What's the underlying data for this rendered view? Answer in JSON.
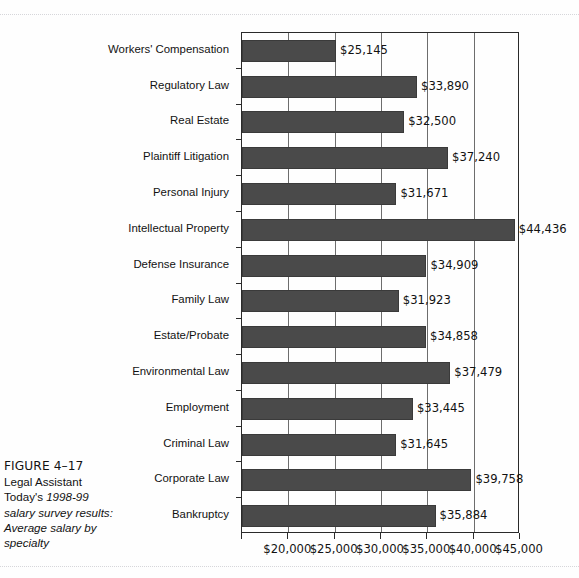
{
  "figure": {
    "number_label": "FIGURE 4–17",
    "caption_lines": [
      {
        "text": "Legal Assistant",
        "italic": false
      },
      {
        "text": "Today's ",
        "italic": false,
        "tail": "1998-99",
        "tail_italic": true
      },
      {
        "text": "salary survey results:",
        "italic": true
      },
      {
        "text": "Average salary by",
        "italic": true
      },
      {
        "text": "specialty",
        "italic": true
      }
    ]
  },
  "colors": {
    "bar_fill": "#4a4a4a",
    "bar_stroke": "#3a3a3a",
    "axis": "#2a2a2a",
    "gridline": "#6d6d6d",
    "text": "#121212",
    "page_background": "#fefefe"
  },
  "chart_data": {
    "type": "bar",
    "orientation": "horizontal",
    "title": "",
    "subtitle": "",
    "xlabel": "",
    "ylabel": "",
    "xlim": [
      15000,
      45000
    ],
    "grid": true,
    "legend": "none",
    "value_label_format": "$#,###",
    "xticks": [
      20000,
      25000,
      30000,
      35000,
      40000,
      45000
    ],
    "xtick_labels": [
      "$20,000",
      "$25,000",
      "$30,000",
      "$35,000",
      "$40,000",
      "$45,000"
    ],
    "categories": [
      "Workers' Compensation",
      "Regulatory Law",
      "Real Estate",
      "Plaintiff Litigation",
      "Personal Injury",
      "Intellectual Property",
      "Defense Insurance",
      "Family Law",
      "Estate/Probate",
      "Environmental Law",
      "Employment",
      "Criminal Law",
      "Corporate Law",
      "Bankruptcy"
    ],
    "values": [
      25145,
      33890,
      32500,
      37240,
      31671,
      44436,
      34909,
      31923,
      34858,
      37479,
      33445,
      31645,
      39758,
      35884
    ],
    "value_labels": [
      "$25,145",
      "$33,890",
      "$32,500",
      "$37,240",
      "$31,671",
      "$44,436",
      "$34,909",
      "$31,923",
      "$34,858",
      "$37,479",
      "$33,445",
      "$31,645",
      "$39,758",
      "$35,884"
    ]
  }
}
